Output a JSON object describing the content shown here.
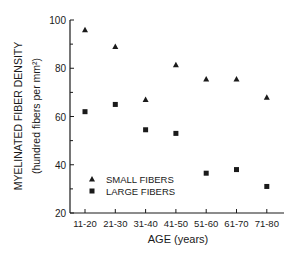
{
  "chart_data": {
    "type": "scatter",
    "title": "",
    "xlabel": "AGE (years)",
    "ylabel": "MYELINATED FIBER DENSITY",
    "ylabel_sub": "(hundred fibers per mm²)",
    "categories": [
      "11-20",
      "21-30",
      "31-40",
      "41-50",
      "51-60",
      "61-70",
      "71-80"
    ],
    "ylim": [
      20,
      100
    ],
    "yticks": [
      20,
      40,
      60,
      80,
      100
    ],
    "grid": false,
    "legend_position": "lower-left inside",
    "series": [
      {
        "name": "SMALL FIBERS",
        "marker": "triangle",
        "values": [
          96,
          89,
          67,
          81.5,
          75.5,
          75.5,
          68
        ]
      },
      {
        "name": "LARGE FIBERS",
        "marker": "square",
        "values": [
          62,
          65,
          54.5,
          53,
          36.5,
          38,
          31
        ]
      }
    ]
  },
  "colors": {
    "ink": "#1a1a1a",
    "background": "#ffffff"
  }
}
